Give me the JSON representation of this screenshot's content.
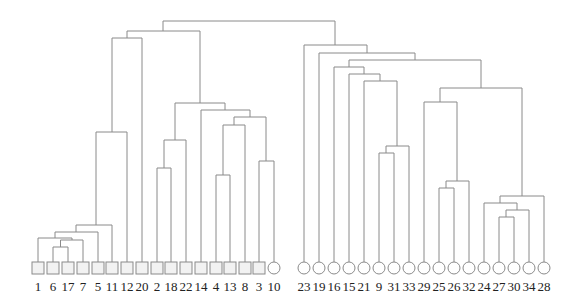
{
  "title": "",
  "chart_data": {
    "type": "dendrogram",
    "leaves": [
      {
        "label": "1",
        "shape": "square",
        "x": 38
      },
      {
        "label": "6",
        "shape": "square",
        "x": 53
      },
      {
        "label": "17",
        "shape": "square",
        "x": 68
      },
      {
        "label": "7",
        "shape": "square",
        "x": 83
      },
      {
        "label": "5",
        "shape": "square",
        "x": 98
      },
      {
        "label": "11",
        "shape": "square",
        "x": 112
      },
      {
        "label": "12",
        "shape": "square",
        "x": 127
      },
      {
        "label": "20",
        "shape": "square",
        "x": 142
      },
      {
        "label": "2",
        "shape": "square",
        "x": 157
      },
      {
        "label": "18",
        "shape": "square",
        "x": 171
      },
      {
        "label": "22",
        "shape": "square",
        "x": 186
      },
      {
        "label": "14",
        "shape": "square",
        "x": 201
      },
      {
        "label": "4",
        "shape": "square",
        "x": 216
      },
      {
        "label": "13",
        "shape": "square",
        "x": 230
      },
      {
        "label": "8",
        "shape": "square",
        "x": 245
      },
      {
        "label": "3",
        "shape": "square",
        "x": 259
      },
      {
        "label": "10",
        "shape": "circle",
        "x": 274
      },
      {
        "label": "23",
        "shape": "circle",
        "x": 304
      },
      {
        "label": "19",
        "shape": "circle",
        "x": 319
      },
      {
        "label": "16",
        "shape": "circle",
        "x": 334
      },
      {
        "label": "15",
        "shape": "circle",
        "x": 349
      },
      {
        "label": "21",
        "shape": "circle",
        "x": 364
      },
      {
        "label": "9",
        "shape": "circle",
        "x": 379
      },
      {
        "label": "31",
        "shape": "circle",
        "x": 394
      },
      {
        "label": "33",
        "shape": "circle",
        "x": 409
      },
      {
        "label": "29",
        "shape": "circle",
        "x": 424
      },
      {
        "label": "25",
        "shape": "circle",
        "x": 439
      },
      {
        "label": "26",
        "shape": "circle",
        "x": 454
      },
      {
        "label": "32",
        "shape": "circle",
        "x": 469
      },
      {
        "label": "24",
        "shape": "circle",
        "x": 484
      },
      {
        "label": "27",
        "shape": "circle",
        "x": 499
      },
      {
        "label": "30",
        "shape": "circle",
        "x": 514
      },
      {
        "label": "34",
        "shape": "circle",
        "x": 529
      },
      {
        "label": "28",
        "shape": "circle",
        "x": 544
      }
    ],
    "leaf_top_y": 262,
    "merges": [
      {
        "xl": 53,
        "xr": 68,
        "yl": 262,
        "yr": 262,
        "y": 247
      },
      {
        "xl": 60.5,
        "xr": 83,
        "yl": 247,
        "yr": 262,
        "y": 240
      },
      {
        "xl": 38,
        "xr": 72,
        "yl": 262,
        "yr": 240,
        "y": 238
      },
      {
        "xl": 55,
        "xr": 98,
        "yl": 238,
        "yr": 262,
        "y": 232
      },
      {
        "xl": 76,
        "xr": 112,
        "yl": 232,
        "yr": 262,
        "y": 225
      },
      {
        "xl": 96,
        "xr": 127,
        "yl": 225,
        "yr": 262,
        "y": 132
      },
      {
        "xl": 112,
        "xr": 142,
        "yl": 132,
        "yr": 262,
        "y": 38
      },
      {
        "xl": 157,
        "xr": 171,
        "yl": 262,
        "yr": 262,
        "y": 168
      },
      {
        "xl": 164,
        "xr": 186,
        "yl": 168,
        "yr": 262,
        "y": 140
      },
      {
        "xl": 216,
        "xr": 230,
        "yl": 262,
        "yr": 262,
        "y": 175
      },
      {
        "xl": 223,
        "xr": 245,
        "yl": 175,
        "yr": 262,
        "y": 125
      },
      {
        "xl": 259,
        "xr": 274,
        "yl": 262,
        "yr": 262,
        "y": 161
      },
      {
        "xl": 234,
        "xr": 266,
        "yl": 125,
        "yr": 161,
        "y": 117
      },
      {
        "xl": 201,
        "xr": 250,
        "yl": 262,
        "yr": 117,
        "y": 110
      },
      {
        "xl": 175,
        "xr": 225,
        "yl": 140,
        "yr": 110,
        "y": 103
      },
      {
        "xl": 127,
        "xr": 200,
        "yl": 38,
        "yr": 103,
        "y": 31
      },
      {
        "xl": 379,
        "xr": 394,
        "yl": 262,
        "yr": 262,
        "y": 153
      },
      {
        "xl": 386,
        "xr": 409,
        "yl": 153,
        "yr": 262,
        "y": 146
      },
      {
        "xl": 364,
        "xr": 397,
        "yl": 262,
        "yr": 146,
        "y": 81
      },
      {
        "xl": 349,
        "xr": 380,
        "yl": 262,
        "yr": 81,
        "y": 74
      },
      {
        "xl": 334,
        "xr": 364,
        "yl": 262,
        "yr": 74,
        "y": 67
      },
      {
        "xl": 439,
        "xr": 454,
        "yl": 262,
        "yr": 262,
        "y": 188
      },
      {
        "xl": 446,
        "xr": 469,
        "yl": 188,
        "yr": 262,
        "y": 181
      },
      {
        "xl": 424,
        "xr": 457,
        "yl": 262,
        "yr": 181,
        "y": 102
      },
      {
        "xl": 499,
        "xr": 514,
        "yl": 262,
        "yr": 262,
        "y": 217
      },
      {
        "xl": 506,
        "xr": 529,
        "yl": 217,
        "yr": 262,
        "y": 210
      },
      {
        "xl": 484,
        "xr": 517,
        "yl": 262,
        "yr": 210,
        "y": 203
      },
      {
        "xl": 500,
        "xr": 544,
        "yl": 203,
        "yr": 262,
        "y": 196
      },
      {
        "xl": 440,
        "xr": 522,
        "yl": 102,
        "yr": 196,
        "y": 88
      },
      {
        "xl": 349,
        "xr": 481,
        "yl": 67,
        "yr": 88,
        "y": 60
      },
      {
        "xl": 319,
        "xr": 415,
        "yl": 262,
        "yr": 60,
        "y": 53
      },
      {
        "xl": 304,
        "xr": 367,
        "yl": 262,
        "yr": 53,
        "y": 45
      },
      {
        "xl": 163,
        "xr": 335,
        "yl": 31,
        "yr": 45,
        "y": 21
      }
    ]
  }
}
